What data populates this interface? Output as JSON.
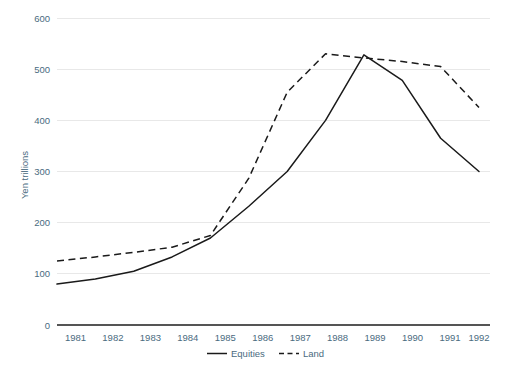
{
  "chart_data": {
    "type": "line",
    "title": "",
    "subtitle": "",
    "xlabel": "",
    "ylabel": "Yen trillions",
    "x": [
      "1981",
      "1982",
      "1983",
      "1984",
      "1985",
      "1986",
      "1987",
      "1988",
      "1989",
      "1990",
      "1991",
      "1992"
    ],
    "categories": [
      "1981",
      "1982",
      "1983",
      "1984",
      "1985",
      "1986",
      "1987",
      "1988",
      "1989",
      "1990",
      "1991",
      "1992"
    ],
    "series": [
      {
        "name": "Equities",
        "style": "solid",
        "color": "#1a1a1a",
        "values": [
          80,
          90,
          105,
          133,
          170,
          232,
          300,
          400,
          528,
          478,
          365,
          300
        ]
      },
      {
        "name": "Land",
        "style": "dashed",
        "color": "#1a1a1a",
        "values": [
          125,
          133,
          142,
          152,
          175,
          287,
          455,
          530,
          522,
          515,
          505,
          425
        ]
      }
    ],
    "ylim": [
      0,
      600
    ],
    "y_ticks": [
      0,
      100,
      200,
      300,
      400,
      500,
      600
    ],
    "y_tick_labels": [
      "0",
      "100",
      "200",
      "300",
      "400",
      "500",
      "600"
    ],
    "x_tick_labels": [
      "1981",
      "1982",
      "1983",
      "1984",
      "1985",
      "1986",
      "1987",
      "1988",
      "1989",
      "1990",
      "1991",
      "1992"
    ],
    "grid": true,
    "grid_axis": "y",
    "legend_position": "bottom-center",
    "legend_entries": [
      "Equities",
      "Land"
    ]
  },
  "axes": {
    "y_title": "Yen trillions",
    "y_tick_labels": {
      "t0": "0",
      "t100": "100",
      "t200": "200",
      "t300": "300",
      "t400": "400",
      "t500": "500",
      "t600": "600"
    },
    "x_tick_labels": {
      "y1981": "1981",
      "y1982": "1982",
      "y1983": "1983",
      "y1984": "1984",
      "y1985": "1985",
      "y1986": "1986",
      "y1987": "1987",
      "y1988": "1988",
      "y1989": "1989",
      "y1990": "1990",
      "y1991": "1991",
      "y1992": "1992"
    }
  },
  "legend": {
    "equities_label": "Equities",
    "land_label": "Land"
  },
  "colors": {
    "line": "#1a1a1a",
    "gridline": "#e8e8e8",
    "axis": "#555555",
    "text": "#4a6b80",
    "background": "#ffffff"
  }
}
